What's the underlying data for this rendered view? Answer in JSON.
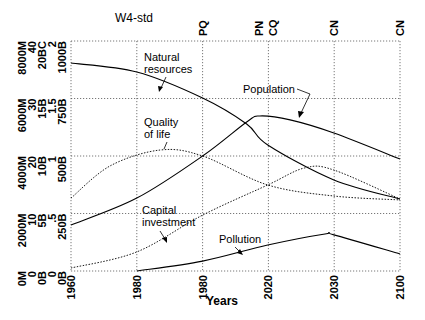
{
  "chart_data": {
    "type": "line",
    "title": "W4-std",
    "xlabel": "Years",
    "ylabel": "",
    "grid": true,
    "x_tick_labels": [
      "1960",
      "1980",
      "1980",
      "2020",
      "2030",
      "2100"
    ],
    "x_range": [
      1960,
      2100
    ],
    "top_markers": [
      {
        "label": "PQ",
        "x_frac": 0.4
      },
      {
        "label": "PN",
        "x_frac": 0.57
      },
      {
        "label": "CQ",
        "x_frac": 0.615
      },
      {
        "label": "CN",
        "x_frac": 0.8
      },
      {
        "label": "CN",
        "x_frac": 1.0
      }
    ],
    "y_axes": [
      {
        "name": "Population",
        "ticks": [
          "0M",
          "2000M",
          "4000M",
          "6000M",
          "8000M"
        ],
        "ylim": [
          0,
          8000
        ]
      },
      {
        "name": "Quality of life",
        "ticks": [
          "0",
          "10",
          "20",
          "30",
          "40"
        ],
        "ylim": [
          0,
          40
        ]
      },
      {
        "name": "Capital investment",
        "ticks": [
          "0B",
          "5B",
          "10B",
          "15B",
          "20BC"
        ],
        "ylim": [
          0,
          20
        ]
      },
      {
        "name": "Pollution",
        "ticks": [
          "0",
          ".5",
          "1",
          "1.5",
          "2"
        ],
        "ylim": [
          0,
          2
        ]
      },
      {
        "name": "Natural resources",
        "ticks": [
          "0B",
          "250B",
          "500B",
          "750B",
          "1000B"
        ],
        "ylim": [
          0,
          1000
        ]
      }
    ],
    "series": [
      {
        "name": "Natural resources",
        "label": "Natural\nresources",
        "style": "solid",
        "points_frac": [
          [
            0,
            0.904
          ],
          [
            0.2,
            0.865
          ],
          [
            0.4,
            0.752
          ],
          [
            0.534,
            0.639
          ],
          [
            0.598,
            0.548
          ],
          [
            0.799,
            0.396
          ],
          [
            1.0,
            0.313
          ]
        ],
        "values_in_units_1000B": [
          904,
          865,
          752,
          639,
          548,
          396,
          313
        ]
      },
      {
        "name": "Population",
        "label": "Population",
        "style": "solid",
        "points_frac": [
          [
            0,
            0.2
          ],
          [
            0.2,
            0.317
          ],
          [
            0.4,
            0.5
          ],
          [
            0.534,
            0.648
          ],
          [
            0.574,
            0.674
          ],
          [
            0.666,
            0.657
          ],
          [
            0.799,
            0.6
          ],
          [
            1.0,
            0.487
          ]
        ],
        "values_in_M": [
          1600,
          2540,
          4000,
          5180,
          5390,
          5260,
          4800,
          3900
        ]
      },
      {
        "name": "Quality of life",
        "label": "Quality\nof life",
        "style": "dotted",
        "points_frac": [
          [
            0,
            0.317
          ],
          [
            0.119,
            0.457
          ],
          [
            0.271,
            0.526
          ],
          [
            0.4,
            0.5
          ],
          [
            0.598,
            0.374
          ],
          [
            0.799,
            0.326
          ],
          [
            1.0,
            0.309
          ]
        ],
        "values_in_40": [
          12.7,
          18.3,
          21.0,
          20.0,
          15.0,
          13.0,
          12.4
        ]
      },
      {
        "name": "Capital investment",
        "label": "Capital\ninvestment",
        "style": "dotted",
        "points_frac": [
          [
            0,
            0.013
          ],
          [
            0.2,
            0.083
          ],
          [
            0.4,
            0.243
          ],
          [
            0.598,
            0.374
          ],
          [
            0.71,
            0.448
          ],
          [
            0.799,
            0.439
          ],
          [
            1.0,
            0.313
          ]
        ],
        "values_in_B": [
          0.3,
          1.7,
          4.9,
          7.5,
          9.0,
          8.8,
          6.3
        ]
      },
      {
        "name": "Pollution",
        "label": "Pollution",
        "style": "solid",
        "points_frac": [
          [
            0.2,
            0.0
          ],
          [
            0.4,
            0.043
          ],
          [
            0.598,
            0.113
          ],
          [
            0.772,
            0.161
          ],
          [
            0.799,
            0.157
          ],
          [
            1.0,
            0.074
          ]
        ],
        "values_in_2": [
          0.0,
          0.09,
          0.23,
          0.32,
          0.31,
          0.15
        ]
      }
    ],
    "annotations": [
      {
        "text": "Natural\nresources",
        "target": "Natural resources"
      },
      {
        "text": "Population",
        "target": "Population"
      },
      {
        "text": "Quality\nof life",
        "target": "Quality of life"
      },
      {
        "text": "Capital\ninvestment",
        "target": "Capital investment"
      },
      {
        "text": "Pollution",
        "target": "Pollution"
      }
    ]
  },
  "labels": {
    "title": "W4-std",
    "xlabel": "Years",
    "ann_nat_1": "Natural",
    "ann_nat_2": "resources",
    "ann_pop": "Population",
    "ann_qol_1": "Quality",
    "ann_qol_2": "of life",
    "ann_cap_1": "Capital",
    "ann_cap_2": "investment",
    "ann_pol": "Pollution"
  }
}
